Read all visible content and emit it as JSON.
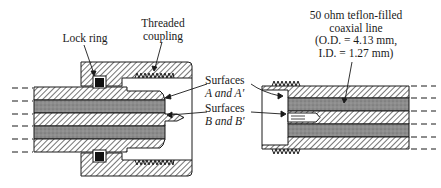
{
  "diagram": {
    "type": "cross-section of SMA coaxial connector pair",
    "labels": {
      "lock_ring": "Lock ring",
      "threaded_coupling_line1": "Threaded",
      "threaded_coupling_line2": "coupling",
      "surfaces_a_line1": "Surfaces",
      "surfaces_a_line2": "A and A′",
      "surfaces_b_line1": "Surfaces",
      "surfaces_b_line2": "B and B′",
      "coax_line1": "50 ohm teflon-filled",
      "coax_line2": "coaxial line",
      "coax_line3": "(O.D. = 4.13 mm,",
      "coax_line4": "I.D. = 1.27 mm)"
    },
    "colors": {
      "outline": "#1a1a1a",
      "hatch": "#2a2a2a",
      "dielectric": "#8a8a8a",
      "lock_ring": "#111111",
      "background": "#ffffff"
    }
  }
}
